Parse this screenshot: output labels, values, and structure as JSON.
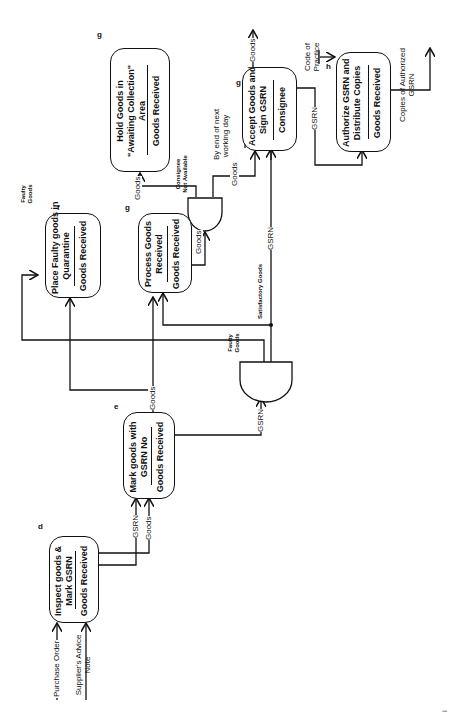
{
  "diagram": {
    "orientation": "rotated 90 degrees counter-clockwise",
    "processes": [
      {
        "id": "d",
        "title_line1": "Inspect goods &",
        "title_line2": "Mark GSRN",
        "mechanism": "Goods Received"
      },
      {
        "id": "e",
        "title_line1": "Mark goods with",
        "title_line2": "GSRN No",
        "mechanism": "Goods Received"
      },
      {
        "id": "f",
        "title_line1": "Place Faulty goods in",
        "title_line2": "Quarantine",
        "mechanism": "Goods Received"
      },
      {
        "id": "g",
        "title_line1": "Process Goods",
        "title_line2": "Received",
        "mechanism": "Goods Received"
      },
      {
        "id": "g",
        "title_line1": "Hold Goods in",
        "title_line2": "\"Awaiting Collection\"",
        "title_line3": "Area",
        "mechanism": "Goods Received"
      },
      {
        "id": "g",
        "title_line1": "Accept Goods and",
        "title_line2": "Sign GSRN",
        "mechanism": "Consignee"
      },
      {
        "id": "h",
        "title_line1": "Authorize GSRN and",
        "title_line2": "Distribute Copies",
        "mechanism": "Goods Received"
      }
    ],
    "flows": {
      "purchase_order": "Purchase Order",
      "suppliers_advice_1": "Supplier's Advice",
      "suppliers_advice_2": "Note",
      "gsrn": "GSRN",
      "goods": "Goods",
      "faulty_goods_1": "Faulty",
      "faulty_goods_2": "Goods",
      "satisfactory_goods": "Satisfactory Goods",
      "consignee_na_1": "Consignee",
      "consignee_na_2": "Not Available",
      "by_end_1": "By end of next",
      "by_end_2": "working day",
      "code_1": "Code of",
      "code_2": "Practice",
      "copies_1": "Copies of Authorized",
      "copies_2": "GSRN"
    },
    "footer_marks": "i"
  }
}
